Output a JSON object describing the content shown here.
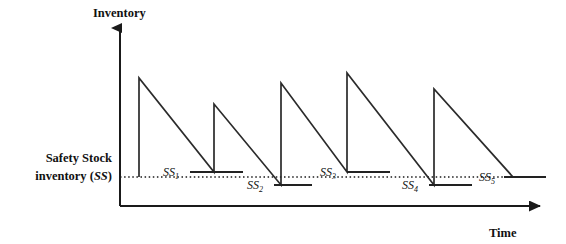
{
  "figure": {
    "kind": "inventory-sawtooth-diagram",
    "background_color": "#ffffff",
    "line_color": "#222222",
    "width": 566,
    "height": 244
  },
  "axes": {
    "y_axis_label": "Inventory",
    "x_axis_label": "Time",
    "origin": {
      "x": 120,
      "y": 206
    },
    "y_axis_top": {
      "x": 120,
      "y": 24
    },
    "x_axis_right": {
      "x": 548,
      "y": 206
    },
    "arrowheads": [
      "y-axis-top",
      "x-axis-right"
    ]
  },
  "safety_stock": {
    "legend_line1": "Safety Stock",
    "legend_line2_prefix": "inventory (",
    "legend_line2_symbol": "SS",
    "legend_line2_suffix": ")",
    "reference_line_y": 177,
    "reference_line_x_start": 120,
    "reference_line_x_end": 546,
    "reference_line_style": "dotted"
  },
  "chart_data": {
    "type": "line",
    "title": "",
    "xlabel": "Time",
    "ylabel": "Inventory",
    "grid": false,
    "legend": "none",
    "safety_stock_level_y": 177,
    "series": [
      {
        "name": "inventory-level",
        "description": "Sawtooth inventory profile: instantaneous replenishment (vertical rise) followed by linear depletion (diagonal fall).",
        "points": [
          {
            "x": 139,
            "y": 177
          },
          {
            "x": 139,
            "y": 78
          },
          {
            "x": 214,
            "y": 172
          },
          {
            "x": 214,
            "y": 104
          },
          {
            "x": 281,
            "y": 185
          },
          {
            "x": 281,
            "y": 83
          },
          {
            "x": 347,
            "y": 172
          },
          {
            "x": 347,
            "y": 73
          },
          {
            "x": 434,
            "y": 185
          },
          {
            "x": 434,
            "y": 89
          },
          {
            "x": 513,
            "y": 177
          }
        ]
      }
    ],
    "cycles": [
      {
        "label": "SS",
        "subscript": "1",
        "end_level_y": 172,
        "relative_to_safety_stock": "above"
      },
      {
        "label": "SS",
        "subscript": "2",
        "end_level_y": 185,
        "relative_to_safety_stock": "below"
      },
      {
        "label": "SS",
        "subscript": "3",
        "end_level_y": 172,
        "relative_to_safety_stock": "above"
      },
      {
        "label": "SS",
        "subscript": "4",
        "end_level_y": 185,
        "relative_to_safety_stock": "below"
      },
      {
        "label": "SS",
        "subscript": "5",
        "end_level_y": 177,
        "relative_to_safety_stock": "at"
      }
    ]
  },
  "markers": [
    {
      "name": "ss1",
      "label": "SS",
      "subscript": "1",
      "label_x": 163,
      "label_y": 176,
      "segment_x1": 190,
      "segment_x2": 243,
      "segment_y": 172
    },
    {
      "name": "ss2",
      "label": "SS",
      "subscript": "2",
      "label_x": 247,
      "label_y": 189,
      "segment_x1": 274,
      "segment_x2": 312,
      "segment_y": 185
    },
    {
      "name": "ss3",
      "label": "SS",
      "subscript": "3",
      "label_x": 320,
      "label_y": 176,
      "segment_x1": 347,
      "segment_x2": 390,
      "segment_y": 172
    },
    {
      "name": "ss4",
      "label": "SS",
      "subscript": "4",
      "label_x": 402,
      "label_y": 189,
      "segment_x1": 429,
      "segment_x2": 472,
      "segment_y": 185
    },
    {
      "name": "ss5",
      "label": "SS",
      "subscript": "5",
      "label_x": 479,
      "label_y": 181,
      "segment_x1": 504,
      "segment_x2": 546,
      "segment_y": 177
    }
  ]
}
